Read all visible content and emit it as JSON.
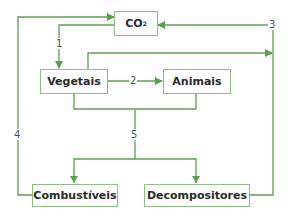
{
  "colors": {
    "line": "#5e9e52",
    "box_border": "#8fbf86",
    "text": "#2a2a2a",
    "label": "#555555"
  },
  "nodes": {
    "co2": {
      "main": "CO",
      "sub": "2"
    },
    "vegetais": "Vegetais",
    "animais": "Animais",
    "combustiveis": "Combustíveis",
    "decompositores": "Decompositores"
  },
  "edges": {
    "e1": {
      "label": "1",
      "from": "CO2",
      "to": "Vegetais"
    },
    "e2": {
      "label": "2",
      "from": "Vegetais",
      "to": "Animais"
    },
    "e3": {
      "label": "3",
      "from": "Vegetais/Decompositores",
      "to": "CO2"
    },
    "e4": {
      "label": "4",
      "from": "Combustíveis",
      "to": "CO2"
    },
    "e5": {
      "label": "5",
      "from": "Vegetais/Animais",
      "to": "Combustíveis/Decompositores"
    }
  }
}
